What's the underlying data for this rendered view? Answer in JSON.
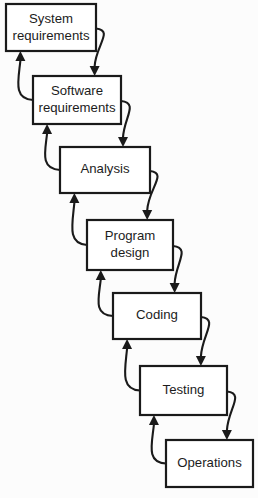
{
  "diagram": {
    "type": "flowchart",
    "background_color": "#fcfcfc",
    "box_fill_color": "#ffffff",
    "box_border_color": "#1a1a1a",
    "arrow_color": "#1a1a1a",
    "text_color": "#1c1c1c",
    "stages": [
      {
        "id": "system-requirements",
        "label_line1": "System",
        "label_line2": "requirements",
        "x": 6,
        "y": 4,
        "width": 90,
        "height": 47
      },
      {
        "id": "software-requirements",
        "label_line1": "Software",
        "label_line2": "requirements",
        "x": 33,
        "y": 76,
        "width": 88,
        "height": 48
      },
      {
        "id": "analysis",
        "label_line1": "Analysis",
        "label_line2": "",
        "x": 60,
        "y": 147,
        "width": 90,
        "height": 46
      },
      {
        "id": "program-design",
        "label_line1": "Program",
        "label_line2": "design",
        "x": 87,
        "y": 220,
        "width": 86,
        "height": 50
      },
      {
        "id": "coding",
        "label_line1": "Coding",
        "label_line2": "",
        "x": 113,
        "y": 293,
        "width": 88,
        "height": 46
      },
      {
        "id": "testing",
        "label_line1": "Testing",
        "label_line2": "",
        "x": 140,
        "y": 366,
        "width": 87,
        "height": 49
      },
      {
        "id": "operations",
        "label_line1": "Operations",
        "label_line2": "",
        "x": 166,
        "y": 440,
        "width": 87,
        "height": 47
      }
    ],
    "forward_flows": [
      {
        "id": "flow-system-to-software",
        "from": "system-requirements",
        "to": "software-requirements"
      },
      {
        "id": "flow-software-to-analysis",
        "from": "software-requirements",
        "to": "analysis"
      },
      {
        "id": "flow-analysis-to-program-design",
        "from": "analysis",
        "to": "program-design"
      },
      {
        "id": "flow-program-design-to-coding",
        "from": "program-design",
        "to": "coding"
      },
      {
        "id": "flow-coding-to-testing",
        "from": "coding",
        "to": "testing"
      },
      {
        "id": "flow-testing-to-operations",
        "from": "testing",
        "to": "operations"
      }
    ],
    "feedback_flows": [
      {
        "id": "feedback-software-to-system",
        "from": "software-requirements",
        "to": "system-requirements"
      },
      {
        "id": "feedback-analysis-to-software",
        "from": "analysis",
        "to": "software-requirements"
      },
      {
        "id": "feedback-program-design-to-analysis",
        "from": "program-design",
        "to": "analysis"
      },
      {
        "id": "feedback-coding-to-program-design",
        "from": "coding",
        "to": "program-design"
      },
      {
        "id": "feedback-testing-to-coding",
        "from": "testing",
        "to": "coding"
      },
      {
        "id": "feedback-operations-to-testing",
        "from": "operations",
        "to": "testing"
      }
    ]
  }
}
